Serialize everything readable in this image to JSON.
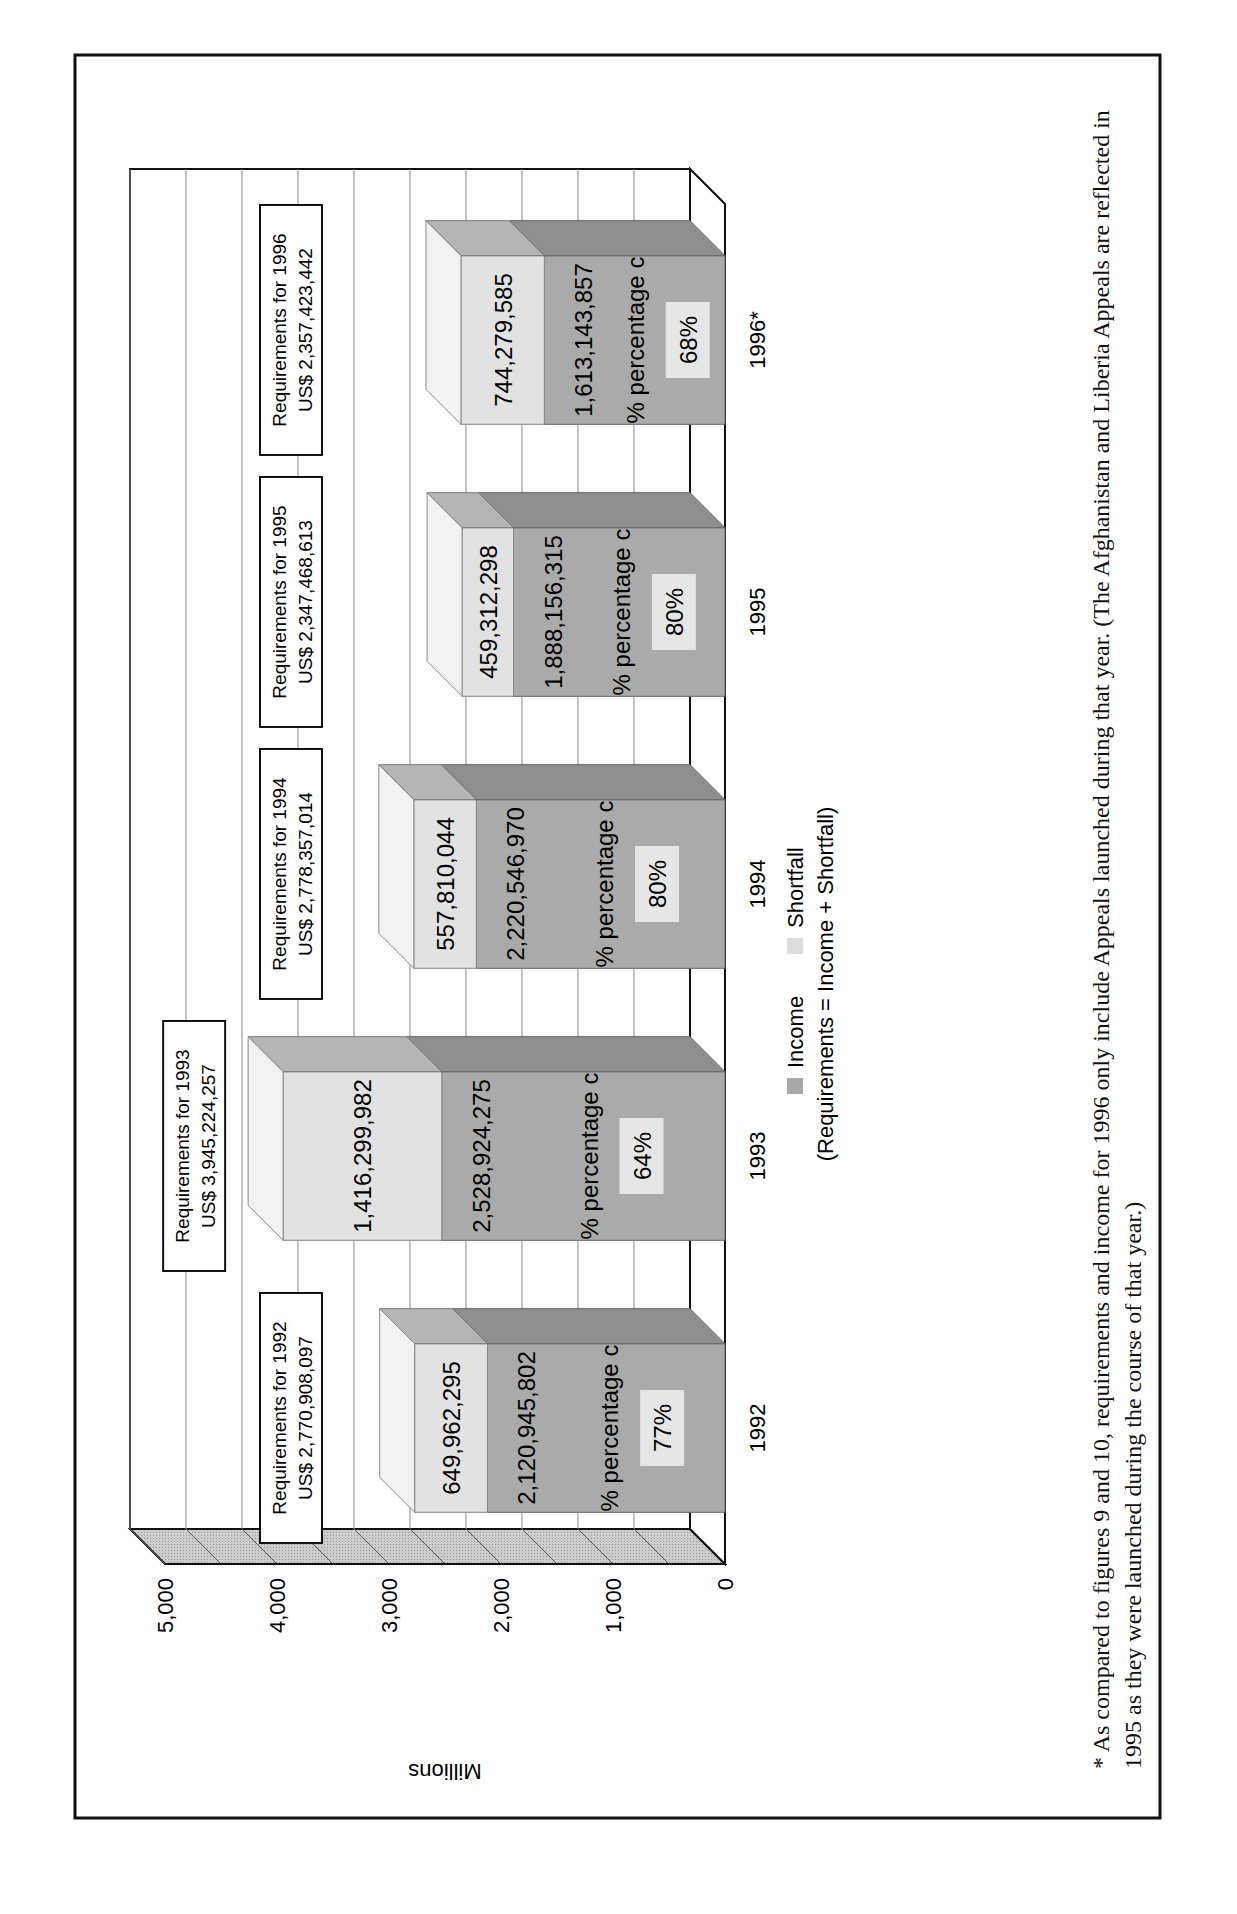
{
  "chart_data": {
    "type": "bar",
    "subtype": "stacked-3d",
    "orientation": "vertical (page rotated 90 degrees counter-clockwise)",
    "title": "",
    "xlabel": "",
    "ylabel": "Millions",
    "ylim": [
      0,
      5000
    ],
    "yticks": [
      "0",
      "1,000",
      "2,000",
      "3,000",
      "4,000",
      "5,000"
    ],
    "grid": true,
    "categories": [
      "1992",
      "1993",
      "1994",
      "1995",
      "1996*"
    ],
    "series": [
      {
        "name": "Income",
        "color": "#a9a9a9",
        "values": [
          2120945802,
          2528924275,
          2220546970,
          1888156315,
          1613143857
        ],
        "labels": [
          "2,120,945,802",
          "2,528,924,275",
          "2,220,546,970",
          "1,888,156,315",
          "1,613,143,857"
        ]
      },
      {
        "name": "Shortfall",
        "color": "#dcdcdc",
        "values": [
          649962295,
          1416299982,
          557810044,
          459312298,
          744279585
        ],
        "labels": [
          "649,962,295",
          "1,416,299,982",
          "557,810,044",
          "459,312,298",
          "744,279,585"
        ]
      }
    ],
    "requirements": [
      {
        "year": "1992",
        "line1": "Requirements for 1992",
        "line2": "US$ 2,770,908,097",
        "value": 2770908097
      },
      {
        "year": "1993",
        "line1": "Requirements for 1993",
        "line2": "US$ 3,945,224,257",
        "value": 3945224257
      },
      {
        "year": "1994",
        "line1": "Requirements for 1994",
        "line2": "US$ 2,778,357,014",
        "value": 2778357014
      },
      {
        "year": "1995",
        "line1": "Requirements for 1995",
        "line2": "US$ 2,347,468,613",
        "value": 2347468613
      },
      {
        "year": "1996*",
        "line1": "Requirements for 1996",
        "line2": "US$ 2,357,423,442",
        "value": 2357423442
      }
    ],
    "percentage_label": "% percentage c",
    "percentages": [
      "77%",
      "64%",
      "80%",
      "80%",
      "68%"
    ],
    "legend": {
      "position": "bottom",
      "items": [
        {
          "label": "Income",
          "color": "#a9a9a9"
        },
        {
          "label": "Shortfall",
          "color": "#dcdcdc"
        }
      ],
      "note": "(Requirements = Income + Shortfall)"
    }
  },
  "footnote": "* As compared to figures 9 and 10, requirements and income for 1996 only include Appeals launched during that year. (The Afghanistan and Liberia Appeals are reflected in 1995 as they were launched during the course of that year.)"
}
